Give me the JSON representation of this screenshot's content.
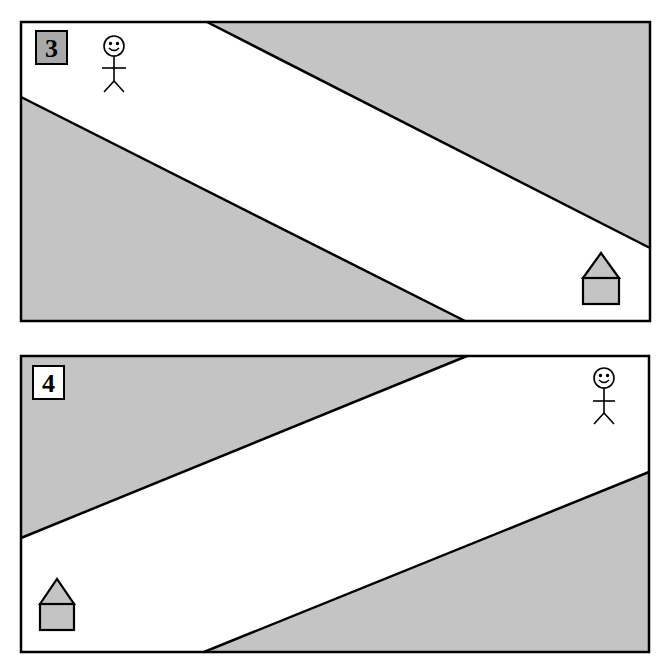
{
  "colors": {
    "gray_fill": "#c4c4c4",
    "white_road": "#ffffff",
    "stroke": "#000000",
    "badge_gray": "#a9a9a9"
  },
  "panels": [
    {
      "label": "3",
      "badge_fill": "#a9a9a9",
      "figure": "stick-person",
      "destination": "house",
      "layout": "road from top-left person to bottom-right house"
    },
    {
      "label": "4",
      "badge_fill": "#ffffff",
      "figure": "stick-person",
      "destination": "house",
      "layout": "road from top-right person to bottom-left house"
    }
  ]
}
